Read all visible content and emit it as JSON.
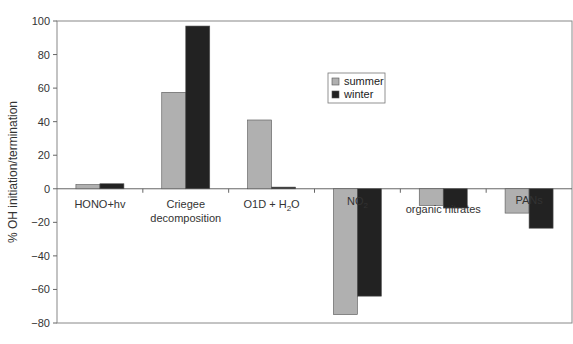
{
  "chart_data": {
    "type": "bar",
    "title": "",
    "xlabel": "",
    "ylabel": "% OH initiation/termination",
    "ylim": [
      -80,
      100
    ],
    "yticks": [
      100,
      80,
      60,
      40,
      20,
      0,
      -20,
      -40,
      -60,
      -80
    ],
    "grid": false,
    "legend_position": "upper center-right",
    "categories": [
      "HONO+hv",
      "Criegee decomposition",
      "O1D + H2O",
      "NO2",
      "organic nitrates",
      "PANs"
    ],
    "category_labels": [
      {
        "lines": [
          "HONO+hv"
        ]
      },
      {
        "lines": [
          "Criegee",
          "decomposition"
        ]
      },
      {
        "lines": [
          "O1D + H",
          "2",
          "O"
        ],
        "subscript": true
      },
      {
        "lines": [
          "NO",
          "2"
        ],
        "subscript": true
      },
      {
        "lines": [
          "organic  nitrates"
        ]
      },
      {
        "lines": [
          "PANs"
        ]
      }
    ],
    "series": [
      {
        "name": "summer",
        "color": "#b0b0b0",
        "values": [
          2.5,
          57.5,
          41,
          -75,
          -10,
          -14.5
        ]
      },
      {
        "name": "winter",
        "color": "#222222",
        "values": [
          3,
          97,
          1,
          -64,
          -11.5,
          -23.5
        ]
      }
    ]
  },
  "legend": {
    "items": [
      {
        "label": "summer",
        "color": "#b0b0b0"
      },
      {
        "label": "winter",
        "color": "#222222"
      }
    ]
  }
}
